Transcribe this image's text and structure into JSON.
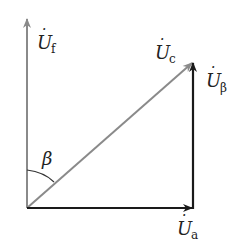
{
  "diagram": {
    "type": "phasor-diagram",
    "colors": {
      "gray_vector": "#8a8a8a",
      "black_vector": "#1a1a1a",
      "label": "#222222"
    },
    "origin": {
      "x": 27,
      "y": 208
    },
    "vectors": [
      {
        "id": "Uf",
        "symbol": "U",
        "subscript": "f",
        "dot": true,
        "from": [
          27,
          208
        ],
        "to": [
          27,
          18
        ],
        "color": "gray"
      },
      {
        "id": "Ua",
        "symbol": "U",
        "subscript": "a",
        "dot": true,
        "from": [
          27,
          208
        ],
        "to": [
          193,
          208
        ],
        "color": "black"
      },
      {
        "id": "Ubeta",
        "symbol": "U",
        "subscript": "β",
        "dot": true,
        "from": [
          193,
          208
        ],
        "to": [
          193,
          62
        ],
        "color": "black"
      },
      {
        "id": "Uc",
        "symbol": "U",
        "subscript": "c",
        "dot": true,
        "from": [
          27,
          208
        ],
        "to": [
          193,
          62
        ],
        "color": "gray"
      }
    ],
    "angle": {
      "symbol": "β",
      "between": [
        "Uf",
        "Uc"
      ]
    },
    "labels": {
      "uf": {
        "main": "U",
        "sub": "f"
      },
      "uc": {
        "main": "U",
        "sub": "c"
      },
      "ubeta": {
        "main": "U",
        "sub": "β"
      },
      "ua": {
        "main": "U",
        "sub": "a"
      },
      "beta": "β",
      "dot": "·"
    }
  }
}
